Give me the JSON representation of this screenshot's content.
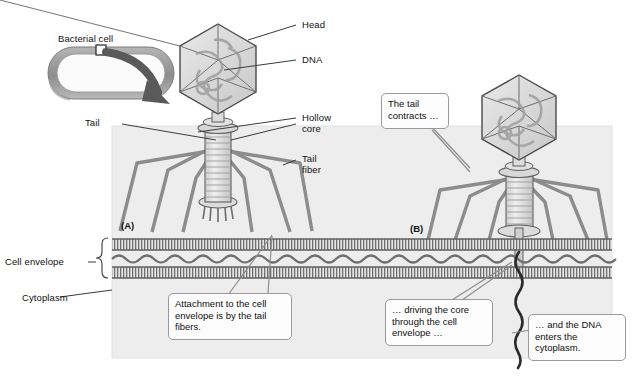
{
  "figure": {
    "panels": [
      {
        "id": "A",
        "label": "(A)"
      },
      {
        "id": "B",
        "label": "(B)"
      }
    ]
  },
  "labels": {
    "bacterial_cell": "Bacterial cell",
    "tail": "Tail",
    "head": "Head",
    "dna": "DNA",
    "hollow_core_line1": "Hollow",
    "hollow_core_line2": "core",
    "tail_fiber_line1": "Tail",
    "tail_fiber_line2": "fiber",
    "cell_envelope": "Cell envelope",
    "cytoplasm": "Cytoplasm"
  },
  "callouts": {
    "attachment": "Attachment to the\ncell envelope is by\nthe tail fibers.",
    "tail_contracts": "The tail\ncontracts …",
    "driving_core": "… driving the core\nthrough the cell\nenvelope …",
    "dna_enters": "… and the DNA\nenters the\ncytoplasm."
  },
  "colors": {
    "background": "#ffffff",
    "panel_fill": "#ededed",
    "membrane_dark": "#6f6f6f",
    "membrane_light": "#d2d2d2",
    "phage_outline": "#5e5e5e",
    "phage_fill": "#dcdcdc",
    "fiber": "#8c8c8c",
    "dna_strand": "#2b2b2b",
    "bacteria_body": "#8f8f8f",
    "arrow": "#5a5a5a",
    "leader_line": "#3a3a3a",
    "callout_border": "#9a9a9a",
    "text": "#111111"
  }
}
